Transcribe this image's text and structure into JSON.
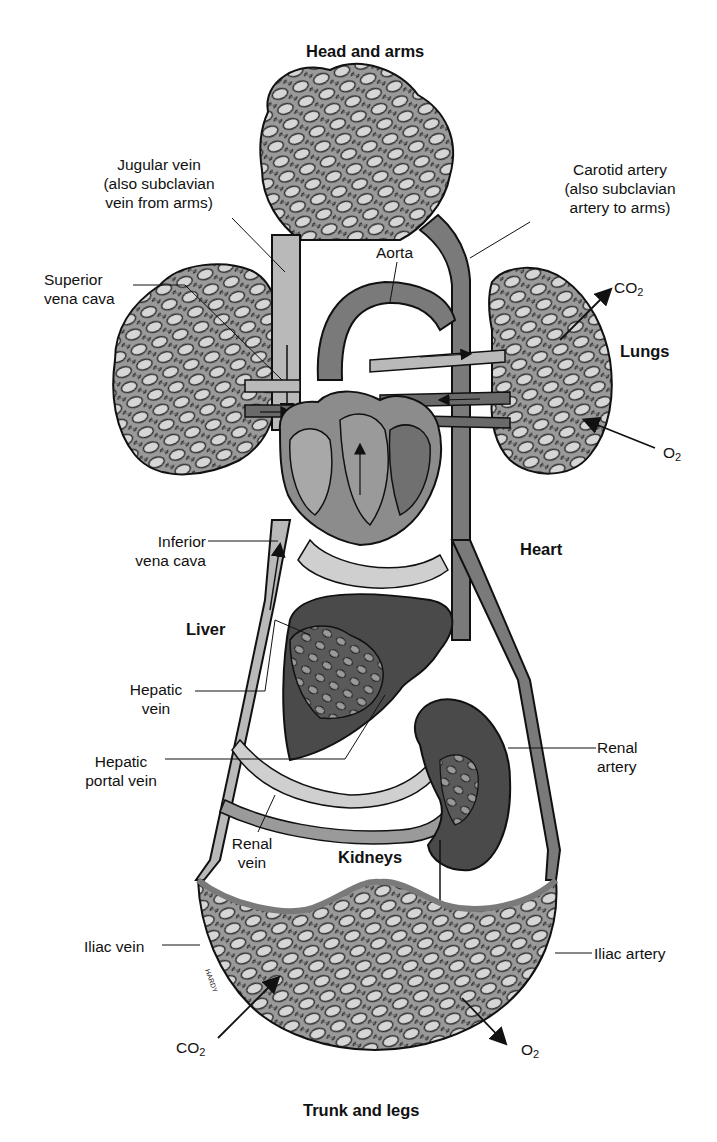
{
  "figure": {
    "regions": {
      "head_arms": "Head and arms",
      "lungs": "Lungs",
      "heart": "Heart",
      "liver": "Liver",
      "kidneys": "Kidneys",
      "trunk_legs": "Trunk and legs"
    },
    "vessels": {
      "jugular_vein": [
        "Jugular vein",
        "(also subclavian",
        "vein from arms)"
      ],
      "carotid_artery": [
        "Carotid artery",
        "(also subclavian",
        "artery to arms)"
      ],
      "aorta": "Aorta",
      "superior_vena_cava": [
        "Superior",
        "vena cava"
      ],
      "inferior_vena_cava": [
        "Inferior",
        "vena cava"
      ],
      "hepatic_vein": [
        "Hepatic",
        "vein"
      ],
      "hepatic_portal_vein": [
        "Hepatic",
        "portal vein"
      ],
      "renal_artery": [
        "Renal",
        "artery"
      ],
      "renal_vein": [
        "Renal",
        "vein"
      ],
      "iliac_vein": "Iliac vein",
      "iliac_artery": "Iliac artery"
    },
    "gases": {
      "lungs_out": {
        "base": "CO",
        "sub": "2"
      },
      "lungs_in": {
        "base": "O",
        "sub": "2"
      },
      "tissue_in": {
        "base": "CO",
        "sub": "2"
      },
      "tissue_out": {
        "base": "O",
        "sub": "2"
      }
    },
    "artist_signature": "HARDY"
  },
  "colors": {
    "vein_gray": "#b9b9b9",
    "artery_gray": "#7a7a7a",
    "organ_dark": "#4a4a4a",
    "heart_gray": "#8c8c8c",
    "outline": "#111111"
  }
}
